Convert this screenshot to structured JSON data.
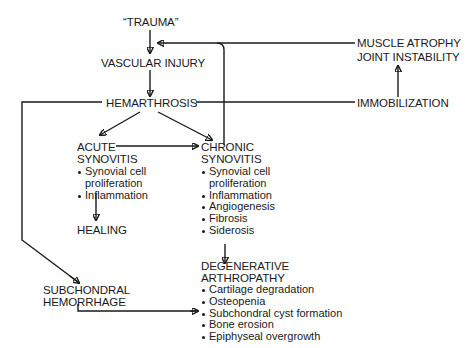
{
  "diagram": {
    "nodes": {
      "trauma": "“TRAUMA”",
      "vascular_injury": "VASCULAR INJURY",
      "hemarthrosis": "HEMARTHROSIS",
      "muscle_atrophy": "MUSCLE ATROPHY",
      "joint_instability": "JOINT INSTABILITY",
      "immobilization": "IMMOBILIZATION",
      "acute_synovitis": {
        "title_line1": "ACUTE",
        "title_line2": "SYNOVITIS",
        "bullets": [
          "Synovial cell",
          "proliferation",
          "Inflammation"
        ]
      },
      "healing": "HEALING",
      "chronic_synovitis": {
        "title_line1": "CHRONIC",
        "title_line2": "SYNOVITIS",
        "bullets": [
          "Synovial cell",
          "proliferation",
          "Inflammation",
          "Angiogenesis",
          "Fibrosis",
          "Siderosis"
        ]
      },
      "subchondral_hemorrhage": {
        "line1": "SUBCHONDRAL",
        "line2": "HEMORRHAGE"
      },
      "degenerative_arthropathy": {
        "title_line1": "DEGENERATIVE",
        "title_line2": "ARTHROPATHY",
        "bullets": [
          "Cartilage degradation",
          "Osteopenia",
          "Subchondral cyst formation",
          "Bone erosion",
          "Epiphyseal overgrowth"
        ]
      }
    },
    "edges": [
      {
        "from": "trauma",
        "to": "vascular_injury"
      },
      {
        "from": "vascular_injury",
        "to": "hemarthrosis"
      },
      {
        "from": "hemarthrosis",
        "to": "acute_synovitis"
      },
      {
        "from": "hemarthrosis",
        "to": "chronic_synovitis"
      },
      {
        "from": "hemarthrosis",
        "to": "immobilization"
      },
      {
        "from": "hemarthrosis",
        "to": "subchondral_hemorrhage"
      },
      {
        "from": "immobilization",
        "to": "muscle_atrophy"
      },
      {
        "from": "muscle_atrophy",
        "to": "vascular_injury"
      },
      {
        "from": "chronic_synovitis",
        "to": "vascular_injury"
      },
      {
        "from": "acute_synovitis",
        "to": "chronic_synovitis"
      },
      {
        "from": "acute_synovitis",
        "to": "healing"
      },
      {
        "from": "chronic_synovitis",
        "to": "degenerative_arthropathy"
      },
      {
        "from": "subchondral_hemorrhage",
        "to": "degenerative_arthropathy"
      }
    ],
    "colors": {
      "ink": "#1a1a1a",
      "background": "#ffffff"
    }
  }
}
